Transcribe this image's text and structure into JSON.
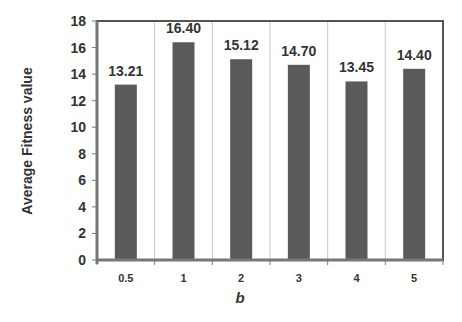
{
  "chart_data": {
    "type": "bar",
    "title": "",
    "xlabel": "b",
    "ylabel": "Average Fitness value",
    "categories": [
      "0.5",
      "1",
      "2",
      "3",
      "4",
      "5"
    ],
    "values": [
      13.21,
      16.4,
      15.12,
      14.7,
      13.45,
      14.4
    ],
    "data_labels": [
      "13.21",
      "16.40",
      "15.12",
      "14.70",
      "13.45",
      "14.40"
    ],
    "ylim": [
      0,
      18
    ],
    "yticks": [
      0,
      2,
      4,
      6,
      8,
      10,
      12,
      14,
      16,
      18
    ],
    "grid": "vertical category separators",
    "legend": "none",
    "bar_color": "#5a5a5a"
  },
  "colors": {
    "bar": "#5a5a5a",
    "axis": "#777777",
    "frame": "#555555",
    "grid": "#c8c8c8",
    "text": "#333333"
  }
}
